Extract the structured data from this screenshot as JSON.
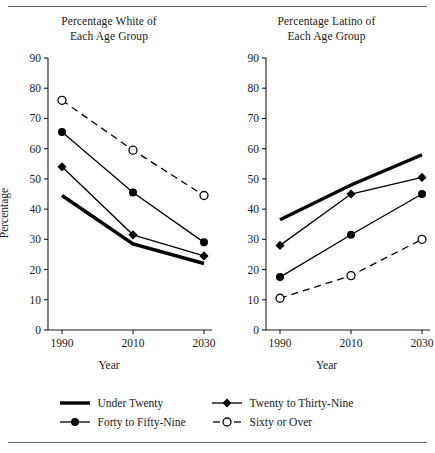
{
  "figure": {
    "ylabel": "Percentage",
    "xlabel": "Year",
    "categories": [
      "1990",
      "2010",
      "2030"
    ],
    "yticks": [
      "90",
      "80",
      "70",
      "60",
      "50",
      "40",
      "30",
      "20",
      "10",
      "0"
    ],
    "ylim": [
      0,
      90
    ]
  },
  "legend": {
    "items": [
      {
        "label": "Under Twenty",
        "marker": "thick-line",
        "dashed": false
      },
      {
        "label": "Twenty to Thirty-Nine",
        "marker": "filled-diamond",
        "dashed": false
      },
      {
        "label": "Forty to Fifty-Nine",
        "marker": "filled-circle",
        "dashed": false
      },
      {
        "label": "Sixty or Over",
        "marker": "open-circle",
        "dashed": true
      }
    ]
  },
  "chart_data": [
    {
      "type": "line",
      "title": "Percentage White of Each Age Group",
      "title_line1": "Percentage White of",
      "title_line2": "Each Age Group",
      "xlabel": "Year",
      "ylabel": "Percentage",
      "x": [
        "1990",
        "2010",
        "2030"
      ],
      "ylim": [
        0,
        90
      ],
      "yticks": [
        0,
        10,
        20,
        30,
        40,
        50,
        60,
        70,
        80,
        90
      ],
      "grid": false,
      "legend_position": "bottom",
      "series": [
        {
          "name": "Under Twenty",
          "values": [
            44.5,
            28.5,
            22.0
          ],
          "style": "thick-solid",
          "marker": "none"
        },
        {
          "name": "Twenty to Thirty-Nine",
          "values": [
            54.0,
            31.5,
            24.5
          ],
          "style": "thin-solid",
          "marker": "filled-diamond"
        },
        {
          "name": "Forty to Fifty-Nine",
          "values": [
            65.5,
            45.5,
            29.0
          ],
          "style": "thin-solid",
          "marker": "filled-circle"
        },
        {
          "name": "Sixty or Over",
          "values": [
            76.0,
            59.5,
            44.5
          ],
          "style": "dashed",
          "marker": "open-circle"
        }
      ]
    },
    {
      "type": "line",
      "title": "Percentage Latino of Each Age Group",
      "title_line1": "Percentage Latino of",
      "title_line2": "Each Age Group",
      "xlabel": "Year",
      "ylabel": "Percentage",
      "x": [
        "1990",
        "2010",
        "2030"
      ],
      "ylim": [
        0,
        90
      ],
      "yticks": [
        0,
        10,
        20,
        30,
        40,
        50,
        60,
        70,
        80,
        90
      ],
      "grid": false,
      "legend_position": "bottom",
      "series": [
        {
          "name": "Under Twenty",
          "values": [
            36.5,
            48.0,
            58.0
          ],
          "style": "thick-solid",
          "marker": "none"
        },
        {
          "name": "Twenty to Thirty-Nine",
          "values": [
            28.0,
            45.0,
            50.5
          ],
          "style": "thin-solid",
          "marker": "filled-diamond"
        },
        {
          "name": "Forty to Fifty-Nine",
          "values": [
            17.5,
            31.5,
            45.0
          ],
          "style": "thin-solid",
          "marker": "filled-circle"
        },
        {
          "name": "Sixty or Over",
          "values": [
            10.5,
            18.0,
            30.0
          ],
          "style": "dashed",
          "marker": "open-circle"
        }
      ]
    }
  ]
}
